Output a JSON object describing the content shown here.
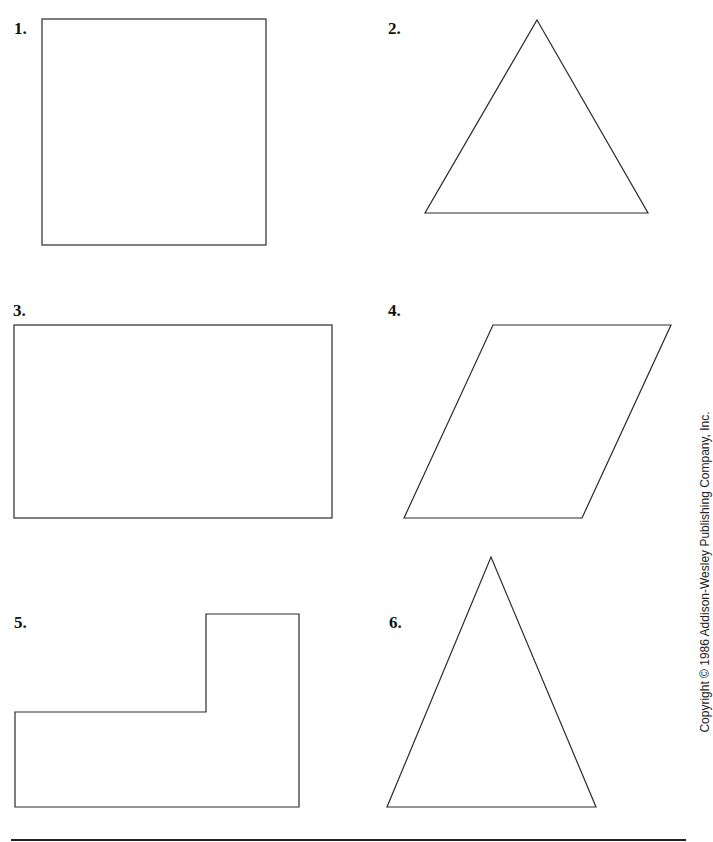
{
  "worksheet": {
    "problems": [
      {
        "number": "1.",
        "shape": "square"
      },
      {
        "number": "2.",
        "shape": "triangle"
      },
      {
        "number": "3.",
        "shape": "rectangle"
      },
      {
        "number": "4.",
        "shape": "parallelogram"
      },
      {
        "number": "5.",
        "shape": "l-shape"
      },
      {
        "number": "6.",
        "shape": "triangle"
      }
    ],
    "copyright": "Copyright © 1986 Addison-Wesley Publishing Company, Inc."
  },
  "colors": {
    "stroke": "#2a2a2a",
    "background": "#ffffff",
    "text": "#111111"
  }
}
